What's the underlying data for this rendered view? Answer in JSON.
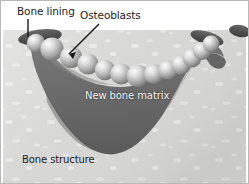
{
  "figure": {
    "width": 249,
    "height": 184,
    "background_color": "#ffffff"
  },
  "labels": {
    "bone_lining": "Bone lining",
    "osteoblasts": "Osteoblasts",
    "new_bone_matrix": "New bone matrix",
    "bone_structure": "Bone structure"
  },
  "colors": {
    "background": "#ffffff",
    "bone_structure_fill": "#d4d4d2",
    "bone_structure_speckle": "#e8e8e6",
    "new_bone_matrix_fill": "#6e6e6e",
    "new_bone_matrix_shade": "#5d5d5d",
    "bone_lining_fill": "#555555",
    "osteoblast_fill": "#9a9a9a",
    "osteoblast_highlight": "#f0f0f0",
    "leader_line": "#1a1a1a",
    "label_dark": "#1d1d1d",
    "label_light": "#f2f2f2",
    "frame_border": "#b9b9b9"
  },
  "structures": {
    "bone_lining_segments": [
      {
        "name": "left-segment",
        "cx": 40,
        "cy": 37,
        "rx": 22,
        "ry": 7,
        "rotation": -8
      },
      {
        "name": "right-segment",
        "cx": 207,
        "cy": 38,
        "rx": 17,
        "ry": 6,
        "rotation": 16
      },
      {
        "name": "far-right-segment",
        "cx": 240,
        "cy": 32,
        "rx": 11,
        "ry": 6,
        "rotation": 10
      }
    ],
    "osteoblast_count": 13,
    "osteoblasts": [
      {
        "cx": 50,
        "cy": 48,
        "r": 11.5
      },
      {
        "cx": 69,
        "cy": 56,
        "r": 11.0
      },
      {
        "cx": 86,
        "cy": 63,
        "r": 10.5
      },
      {
        "cx": 103,
        "cy": 70,
        "r": 10.2
      },
      {
        "cx": 119,
        "cy": 74,
        "r": 10.5
      },
      {
        "cx": 136,
        "cy": 76,
        "r": 11.0
      },
      {
        "cx": 152,
        "cy": 74,
        "r": 10.0
      },
      {
        "cx": 166,
        "cy": 71,
        "r": 9.5
      },
      {
        "cx": 179,
        "cy": 66,
        "r": 9.5
      },
      {
        "cx": 191,
        "cy": 59,
        "r": 9.5
      },
      {
        "cx": 201,
        "cy": 52,
        "r": 9.0
      },
      {
        "cx": 209,
        "cy": 45,
        "r": 8.5
      },
      {
        "cx": 36,
        "cy": 42,
        "r": 9.0
      }
    ],
    "leader_lines": [
      {
        "name": "bone-lining-leader",
        "x1": 28,
        "y1": 19,
        "x2": 28,
        "y2": 36
      },
      {
        "name": "osteoblasts-leader",
        "x1": 99,
        "y1": 24,
        "x2": 70,
        "y2": 52
      }
    ]
  }
}
